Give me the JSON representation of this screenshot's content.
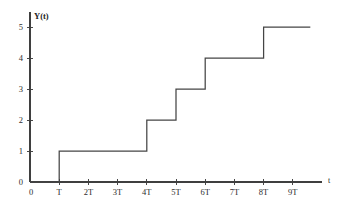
{
  "chart_data": {
    "type": "line",
    "subtype": "step-post",
    "title": "",
    "subtitle": "",
    "xlabel": "t",
    "ylabel": "Y(t)",
    "x_tick_labels": [
      "0",
      "T",
      "2T",
      "3T",
      "4T",
      "5T",
      "6T",
      "7T",
      "8T",
      "9T"
    ],
    "x_tick_values": [
      0,
      1,
      2,
      3,
      4,
      5,
      6,
      7,
      8,
      9
    ],
    "y_tick_labels": [
      "0",
      "1",
      "2",
      "3",
      "4",
      "5"
    ],
    "y_tick_values": [
      0,
      1,
      2,
      3,
      4,
      5
    ],
    "xlim": [
      0,
      10
    ],
    "ylim": [
      0,
      5.4
    ],
    "grid": false,
    "legend": false,
    "legend_position": "none",
    "jump_times": [
      1,
      4,
      5,
      6,
      8
    ],
    "jump_labels": [
      "T",
      "4T",
      "5T",
      "6T",
      "8T"
    ],
    "x": [
      0,
      1,
      1,
      4,
      4,
      5,
      5,
      6,
      6,
      8,
      8,
      9.6
    ],
    "y": [
      0,
      0,
      1,
      1,
      2,
      2,
      3,
      3,
      4,
      4,
      5,
      5
    ],
    "steps": [
      {
        "from_x": 0,
        "to_x": 1,
        "value": 0
      },
      {
        "from_x": 1,
        "to_x": 4,
        "value": 1
      },
      {
        "from_x": 4,
        "to_x": 5,
        "value": 2
      },
      {
        "from_x": 5,
        "to_x": 6,
        "value": 3
      },
      {
        "from_x": 6,
        "to_x": 8,
        "value": 4
      },
      {
        "from_x": 8,
        "to_x": 9.6,
        "value": 5
      }
    ],
    "line_color": "#454545",
    "axis_color": "#3f3f3f",
    "background_color": "#ffffff"
  },
  "geometry": {
    "origin_x": 30,
    "origin_y": 182,
    "axis_top_y": 12,
    "axis_right_x": 322,
    "unit_x": 29.2,
    "unit_y": 31.0,
    "tick_up": 3,
    "tick_down": 3
  }
}
